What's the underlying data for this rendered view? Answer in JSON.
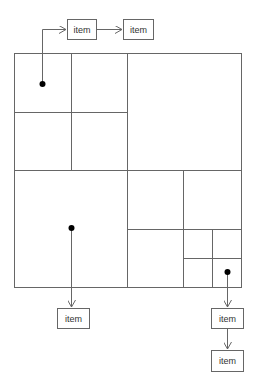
{
  "diagram": {
    "type": "quadtree-with-linked-lists",
    "colors": {
      "line": "#666666",
      "dot": "#000000",
      "box_border": "#666666",
      "text": "#333333",
      "background": "#ffffff"
    },
    "outer_rect": {
      "x": 14,
      "y": 53,
      "w": 227,
      "h": 234
    },
    "grid_lines": [
      {
        "x1": 14,
        "y1": 170,
        "x2": 241,
        "y2": 170
      },
      {
        "x1": 127,
        "y1": 53,
        "x2": 127,
        "y2": 287
      },
      {
        "x1": 71,
        "y1": 53,
        "x2": 71,
        "y2": 170
      },
      {
        "x1": 14,
        "y1": 112,
        "x2": 127,
        "y2": 112
      },
      {
        "x1": 127,
        "y1": 229,
        "x2": 241,
        "y2": 229
      },
      {
        "x1": 183,
        "y1": 170,
        "x2": 183,
        "y2": 287
      },
      {
        "x1": 212,
        "y1": 229,
        "x2": 212,
        "y2": 287
      },
      {
        "x1": 183,
        "y1": 258,
        "x2": 241,
        "y2": 258
      }
    ],
    "points": [
      {
        "x": 42,
        "y": 84
      },
      {
        "x": 71,
        "y": 228
      },
      {
        "x": 227,
        "y": 272
      }
    ],
    "items": [
      {
        "label": "item",
        "x": 67,
        "y": 19,
        "w": 29,
        "h": 20
      },
      {
        "label": "item",
        "x": 123,
        "y": 19,
        "w": 30,
        "h": 20
      },
      {
        "label": "item",
        "x": 57,
        "y": 308,
        "w": 32,
        "h": 20
      },
      {
        "label": "item",
        "x": 211,
        "y": 308,
        "w": 32,
        "h": 20
      },
      {
        "label": "item",
        "x": 211,
        "y": 350,
        "w": 32,
        "h": 21
      }
    ]
  }
}
